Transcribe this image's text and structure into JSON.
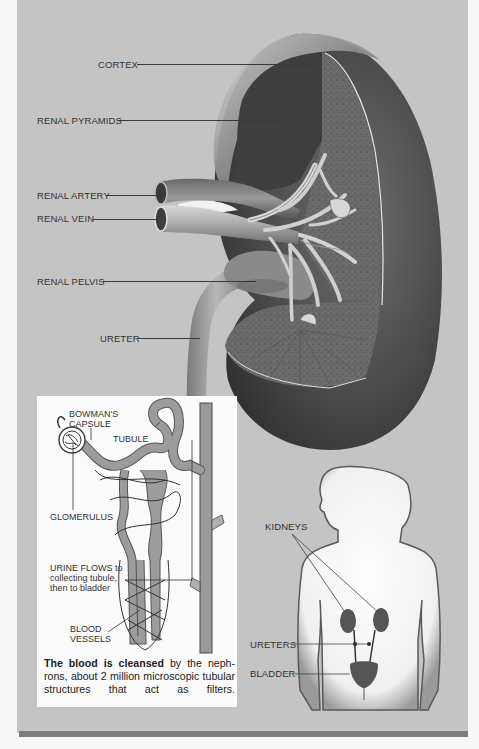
{
  "figure": {
    "colors": {
      "panel_background": "#c4c4c4",
      "inset_background": "#fbfbfb",
      "bottom_rule": "#7d7d7d",
      "kidney_dark": "#3c3c3c",
      "vessel_light": "#b8b8b8",
      "tubule_gray": "#9a9a9a"
    }
  },
  "kidney_cross_section": {
    "labels": {
      "cortex": "CORTEX",
      "renal_pyramids": "RENAL PYRAMIDS",
      "renal_artery": "RENAL ARTERY",
      "renal_vein": "RENAL VEIN",
      "renal_pelvis": "RENAL PELVIS",
      "ureter": "URETER"
    }
  },
  "nephron_inset": {
    "labels": {
      "bowmans_capsule_1": "BOWMAN'S",
      "bowmans_capsule_2": "CAPSULE",
      "tubule": "TUBULE",
      "glomerulus": "GLOMERULUS",
      "urine_flows_1_bold": "URINE FLOWS",
      "urine_flows_1_rest": " to",
      "urine_flows_2": "collecting tubule,",
      "urine_flows_3": "then to bladder",
      "blood_vessels_1": "BLOOD",
      "blood_vessels_2": "VESSELS"
    },
    "caption": {
      "lead": "The blood is cleansed",
      "body": " by the neph-rons, about 2 million microscopic tubular structures that act as filters."
    }
  },
  "body_figure": {
    "labels": {
      "kidneys": "KIDNEYS",
      "ureters": "URETERS",
      "bladder": "BLADDER"
    }
  }
}
